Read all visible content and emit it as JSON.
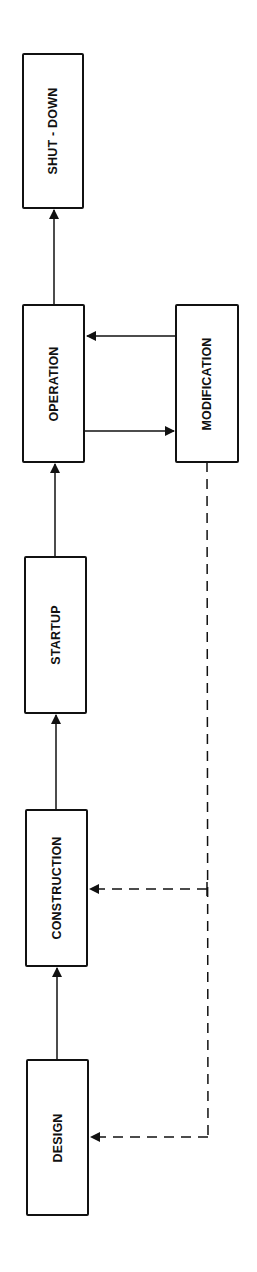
{
  "diagram": {
    "title": "",
    "nodes": [
      {
        "id": "shutdown",
        "label": "SHUT - DOWN"
      },
      {
        "id": "operation",
        "label": "OPERATION"
      },
      {
        "id": "modification",
        "label": "MODIFICATION"
      },
      {
        "id": "startup",
        "label": "STARTUP"
      },
      {
        "id": "construction",
        "label": "CONSTRUCTION"
      },
      {
        "id": "design",
        "label": "DESIGN"
      }
    ],
    "edges": [
      {
        "from": "design",
        "to": "construction",
        "style": "solid"
      },
      {
        "from": "construction",
        "to": "startup",
        "style": "solid"
      },
      {
        "from": "startup",
        "to": "operation",
        "style": "solid"
      },
      {
        "from": "operation",
        "to": "shutdown",
        "style": "solid"
      },
      {
        "from": "operation",
        "to": "modification",
        "style": "solid"
      },
      {
        "from": "modification",
        "to": "operation",
        "style": "solid"
      },
      {
        "from": "modification",
        "to": "construction",
        "style": "dashed"
      },
      {
        "from": "modification",
        "to": "design",
        "style": "dashed"
      }
    ],
    "colors": {
      "line": "#111111",
      "background": "#ffffff"
    }
  }
}
